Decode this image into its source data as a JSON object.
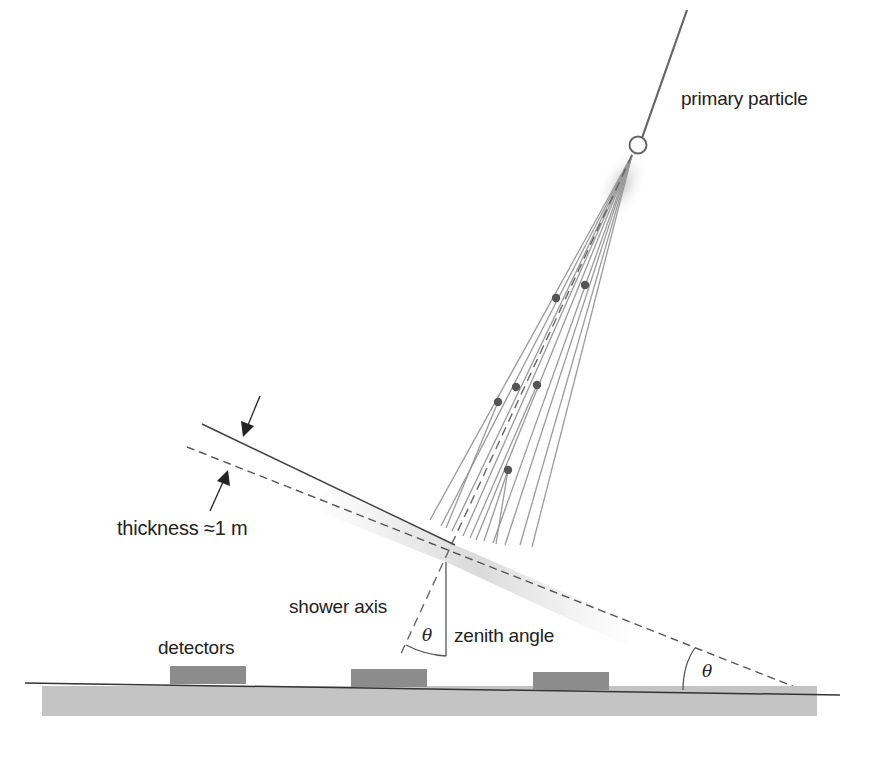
{
  "diagram": {
    "labels": {
      "primary_particle": "primary particle",
      "thickness": "thickness ≈1 m",
      "shower_axis": "shower axis",
      "zenith_angle": "zenith angle",
      "detectors": "detectors",
      "theta_zenith": "θ",
      "theta_ground": "θ"
    },
    "colors": {
      "line": "#555555",
      "shower_tracks": "#9a9a9a",
      "particle_dots": "#555555",
      "ground_bar": "#c4c4c4",
      "detector": "#8c8c8c",
      "shower_front_shading": "#d8d8d8",
      "text": "#222222"
    },
    "elements": {
      "detector_count": 3,
      "secondary_particle_count": 6
    }
  }
}
